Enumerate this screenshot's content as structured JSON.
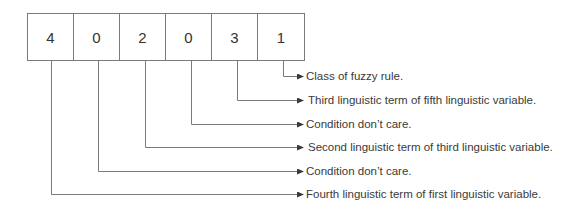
{
  "diagram": {
    "cells": [
      "4",
      "0",
      "2",
      "0",
      "3",
      "1"
    ],
    "annotations": [
      {
        "cell_index": 5,
        "text": "Class of fuzzy rule."
      },
      {
        "cell_index": 4,
        "text": "Third linguistic term of fifth linguistic variable."
      },
      {
        "cell_index": 3,
        "text": "Condition don’t care."
      },
      {
        "cell_index": 2,
        "text": "Second linguistic term of third linguistic variable."
      },
      {
        "cell_index": 1,
        "text": "Condition don’t care."
      },
      {
        "cell_index": 0,
        "text": "Fourth linguistic term of first linguistic variable."
      }
    ],
    "colors": {
      "line": "#7a7a7a",
      "text": "#3a3a3a",
      "arrow": "#3a3a3a"
    }
  }
}
